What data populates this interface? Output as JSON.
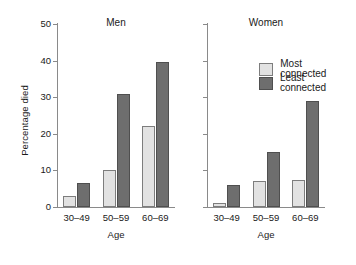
{
  "chart_data": {
    "type": "bar",
    "title": "",
    "xlabel": "Age",
    "ylabel": "Percentage died",
    "ylim": [
      0,
      50
    ],
    "yticks": [
      0,
      10,
      20,
      30,
      40,
      50
    ],
    "ytick_labels": [
      "0",
      "10",
      "20",
      "30",
      "40",
      "50"
    ],
    "grid": false,
    "legend_position": "top-right (inside Women panel)",
    "categories": [
      "30–49",
      "50–59",
      "60–69"
    ],
    "legend": [
      "Most connected",
      "Least connected"
    ],
    "panels": [
      {
        "title": "Men",
        "show_ytick_labels": true,
        "series": [
          {
            "name": "Most connected",
            "values": [
              3,
              10,
              22
            ]
          },
          {
            "name": "Least connected",
            "values": [
              6.5,
              31,
              39.5
            ]
          }
        ]
      },
      {
        "title": "Women",
        "show_ytick_labels": false,
        "series": [
          {
            "name": "Most connected",
            "values": [
              1,
              7,
              7.5
            ]
          },
          {
            "name": "Least connected",
            "values": [
              6,
              15,
              29
            ]
          }
        ]
      }
    ],
    "colors": {
      "most_connected": "#e2e2e2",
      "least_connected": "#6e6e6e",
      "axis": "#8a8a8a",
      "text": "#1a1a1a",
      "background": "#ffffff"
    }
  }
}
